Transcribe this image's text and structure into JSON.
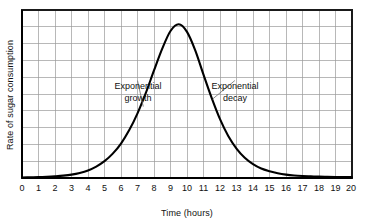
{
  "chart_data": {
    "type": "line",
    "title": "",
    "xlabel": "Time (hours)",
    "ylabel": "Rate of sugar consumption",
    "xlim": [
      0,
      20
    ],
    "ylim": [
      0,
      10
    ],
    "grid": true,
    "legend": "none",
    "x_ticks": [
      "0",
      "1",
      "2",
      "3",
      "4",
      "5",
      "6",
      "7",
      "8",
      "9",
      "10",
      "11",
      "12",
      "13",
      "14",
      "15",
      "16",
      "17",
      "18",
      "19",
      "20"
    ],
    "y_ticks": [],
    "x_gridline_count": 21,
    "y_gridline_count": 11,
    "series": [
      {
        "name": "Rate of sugar consumption",
        "x": [
          0,
          0.5,
          1,
          1.5,
          2,
          2.5,
          3,
          3.5,
          4,
          4.5,
          5,
          5.5,
          6,
          6.5,
          7,
          7.5,
          8,
          8.5,
          9,
          9.5,
          10,
          10.5,
          11,
          11.5,
          12,
          12.5,
          13,
          13.5,
          14,
          14.5,
          15,
          15.5,
          16,
          16.5,
          17,
          17.5,
          18,
          18.5,
          19,
          19.5,
          20
        ],
        "y": [
          0.03,
          0.04,
          0.05,
          0.07,
          0.1,
          0.14,
          0.2,
          0.3,
          0.45,
          0.68,
          1.0,
          1.45,
          2.05,
          2.85,
          3.85,
          5.05,
          6.4,
          7.7,
          8.75,
          9.15,
          8.7,
          7.6,
          6.15,
          4.75,
          3.5,
          2.5,
          1.75,
          1.2,
          0.82,
          0.56,
          0.4,
          0.28,
          0.2,
          0.15,
          0.12,
          0.1,
          0.08,
          0.07,
          0.06,
          0.05,
          0.05
        ]
      }
    ],
    "peak": {
      "x": 9,
      "y": 9.2
    },
    "annotations": [
      {
        "id": "growth",
        "line1": "Exponential",
        "line2": "growth",
        "text_x": 7.0,
        "text_y": 5.8,
        "target_x": 7.35,
        "target_y": 4.25
      },
      {
        "id": "decay",
        "line1": "Exponential",
        "line2": "decay",
        "text_x": 12.9,
        "text_y": 5.8,
        "target_x": 11.55,
        "target_y": 4.7
      }
    ]
  },
  "colors": {
    "curve": "#000000",
    "grid": "#9a9a9a",
    "axis": "#1a1a1a",
    "text": "#111111",
    "leader": "#6e6e6e",
    "background": "#ffffff"
  },
  "axis": {
    "x_title": "Time (hours)",
    "y_title": "Rate of sugar consumption"
  },
  "ticks": {
    "t0": "0",
    "t1": "1",
    "t2": "2",
    "t3": "3",
    "t4": "4",
    "t5": "5",
    "t6": "6",
    "t7": "7",
    "t8": "8",
    "t9": "9",
    "t10": "10",
    "t11": "11",
    "t12": "12",
    "t13": "13",
    "t14": "14",
    "t15": "15",
    "t16": "16",
    "t17": "17",
    "t18": "18",
    "t19": "19",
    "t20": "20"
  },
  "annotations": {
    "growth_line1": "Exponential",
    "growth_line2": "growth",
    "decay_line1": "Exponential",
    "decay_line2": "decay"
  }
}
